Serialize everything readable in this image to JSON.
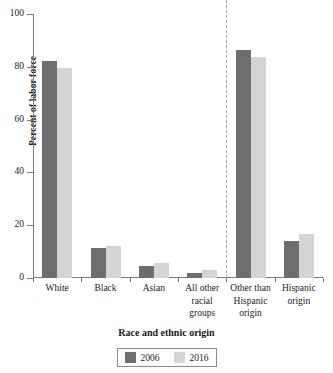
{
  "chart_data": {
    "type": "bar",
    "title": "",
    "xlabel": "Race and ethnic origin",
    "ylabel": "Percent of labor force",
    "categories": [
      "White",
      "Black",
      "Asian",
      "All other racial groups",
      "Other than Hispanic origin",
      "Hispanic origin"
    ],
    "category_lines": [
      [
        "White"
      ],
      [
        "Black"
      ],
      [
        "Asian"
      ],
      [
        "All other",
        "racial",
        "groups"
      ],
      [
        "Other than",
        "Hispanic",
        "origin"
      ],
      [
        "Hispanic",
        "origin"
      ]
    ],
    "series": [
      {
        "name": "2006",
        "color": "#6e6e6e",
        "values": [
          82.2,
          11.4,
          4.4,
          2.0,
          86.4,
          14.0
        ]
      },
      {
        "name": "2016",
        "color": "#d4d4d4",
        "values": [
          79.5,
          12.3,
          5.7,
          2.9,
          83.6,
          16.8
        ]
      }
    ],
    "ylim": [
      0,
      100
    ],
    "yticks": [
      0,
      20,
      40,
      60,
      80,
      100
    ],
    "ytick_labels": [
      "0",
      "20",
      "40",
      "60",
      "80",
      "100"
    ],
    "grid": false,
    "legend_position": "bottom",
    "divider_after_category_index": 3,
    "divider_style": "dashed"
  },
  "legend": {
    "items": [
      {
        "label": "2006",
        "color": "#6e6e6e"
      },
      {
        "label": "2016",
        "color": "#d4d4d4"
      }
    ]
  },
  "axes": {
    "y_title": "Percent of labor force",
    "x_title": "Race and ethnic origin"
  }
}
